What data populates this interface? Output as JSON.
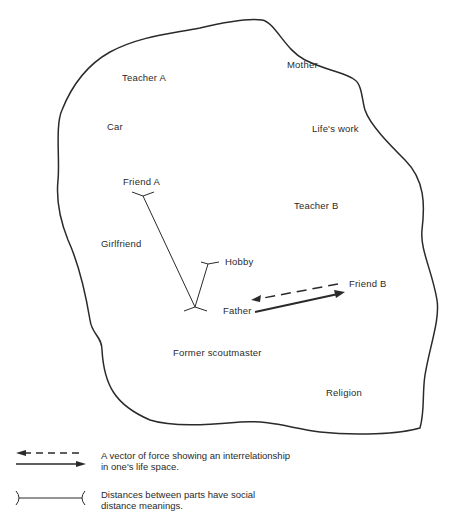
{
  "diagram": {
    "labels": {
      "teacher_a": "Teacher  A",
      "mother": "Mother",
      "car": "Car",
      "lifes_work": "Life's work",
      "friend_a": "Friend  A",
      "teacher_b": "Teacher  B",
      "girlfriend": "Girlfriend",
      "hobby": "Hobby",
      "friend_b": "Friend  B",
      "father": "Father",
      "former_scoutmaster": "Former scoutmaster",
      "religion": "Religion"
    },
    "connections": [
      {
        "type": "social-distance",
        "from": "Friend A",
        "to": "Father"
      },
      {
        "type": "social-distance",
        "from": "Hobby",
        "to": "Father"
      },
      {
        "type": "vector-dashed",
        "from": "Friend B",
        "to": "Father"
      },
      {
        "type": "vector-solid",
        "from": "Father",
        "to": "Friend B"
      }
    ]
  },
  "legend": {
    "vector": {
      "line1": "A vector of force showing an interrelationship",
      "line2": "in one's life space."
    },
    "distance": {
      "line1": "Distances between parts have social",
      "line2": "distance meanings."
    }
  },
  "colors": {
    "ink": "#2a2a2a",
    "background": "#ffffff"
  }
}
